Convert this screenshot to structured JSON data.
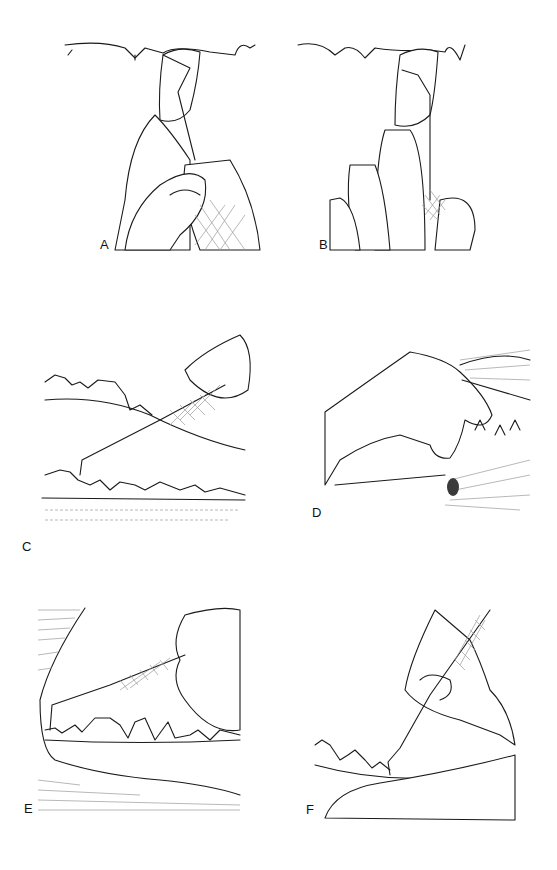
{
  "figure": {
    "panels": [
      {
        "id": "A",
        "label": "A",
        "subject": "modified pen grasp, instrument tip at tooth crown, thumb and fingers holding cross-hatched handle"
      },
      {
        "id": "B",
        "label": "B",
        "subject": "instrument tip inserted under gumline of tooth, finger rest on tooth"
      },
      {
        "id": "C",
        "label": "C",
        "subject": "probe inserted into gingival sulcus of lower teeth, hand holding cross-hatched handle"
      },
      {
        "id": "D",
        "label": "D",
        "subject": "hand retracting lip of animal muzzle exposing teeth"
      },
      {
        "id": "E",
        "label": "E",
        "subject": "instrument at rear tooth of mandible, fingers resting on teeth"
      },
      {
        "id": "F",
        "label": "F",
        "subject": "instrument tip angled into sulcus, finger rest on jaw"
      }
    ]
  }
}
